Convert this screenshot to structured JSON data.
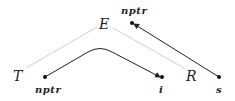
{
  "diagram": {
    "nodes": {
      "E": {
        "label": "E"
      },
      "T": {
        "label": "T"
      },
      "R": {
        "label": "R"
      },
      "nptr_top": {
        "label": "nptr"
      },
      "nptr_bottom": {
        "label": "nptr"
      },
      "i": {
        "label": "i"
      },
      "s": {
        "label": "s"
      }
    },
    "edges": [
      {
        "from": "E",
        "to": "T",
        "style": "light-gray line"
      },
      {
        "from": "E",
        "to": "R",
        "style": "light-gray line"
      },
      {
        "from": "nptr_bottom",
        "to": "i",
        "style": "black curved arrow"
      },
      {
        "from": "s",
        "to": "nptr_top",
        "style": "black arrow"
      }
    ],
    "colors": {
      "tree_edge": "#cfcfcf",
      "arrow": "#222222"
    }
  }
}
